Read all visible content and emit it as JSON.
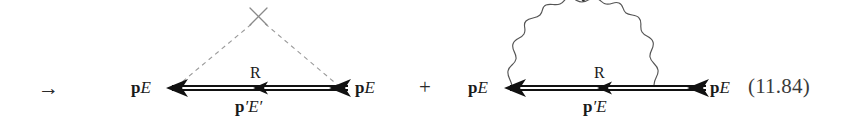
{
  "figure": {
    "equation_number": "(11.84)",
    "leading_operator": "→",
    "joining_operator": "+",
    "background_color": "#ffffff",
    "ink_color": "#1a1a1a",
    "dashed_line_color": "#8c8c8c",
    "wavy_line_color": "#4a4a4a"
  },
  "diagram1": {
    "name": "external-potential-scattering-diagram",
    "left_label": {
      "bold": "p",
      "italic": "E",
      "prime_p": "",
      "prime_e": ""
    },
    "right_label": {
      "bold": "p",
      "italic": "E",
      "prime_p": "",
      "prime_e": ""
    },
    "propagator_label": "R",
    "lower_label": {
      "bold": "p",
      "prime_p": "′",
      "italic": "E",
      "prime_e": "′"
    },
    "vertex_marker": "cross",
    "interaction_line_style": "dashed",
    "fermion_line_style": "solid-double"
  },
  "diagram2": {
    "name": "self-energy-photon-loop-diagram",
    "left_label": {
      "bold": "p",
      "italic": "E",
      "prime_p": "",
      "prime_e": ""
    },
    "right_label": {
      "bold": "p",
      "italic": "E",
      "prime_p": "",
      "prime_e": ""
    },
    "propagator_label": "R",
    "lower_label": {
      "bold": "p",
      "prime_p": "′",
      "italic": "E",
      "prime_e": ""
    },
    "interaction_line_style": "wavy",
    "fermion_line_style": "solid-double"
  }
}
